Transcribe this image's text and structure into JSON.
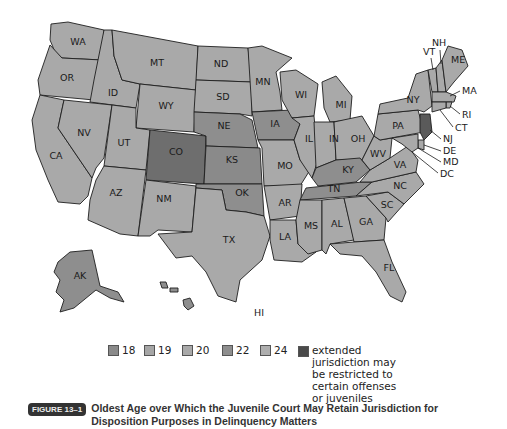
{
  "colors": {
    "age18": "#8a8a8a",
    "age19": "#a6a6a6",
    "age20": "#a9a9a9",
    "age22": "#8e8e8e",
    "age24": "#aeaeae",
    "extended": "#5a5a5a",
    "co": "#6e6e6e"
  },
  "legend": {
    "items": [
      {
        "label": "18",
        "color": "#8a8a8a"
      },
      {
        "label": "19",
        "color": "#a6a6a6"
      },
      {
        "label": "20",
        "color": "#a9a9a9"
      },
      {
        "label": "22",
        "color": "#8e8e8e"
      },
      {
        "label": "24",
        "color": "#aeaeae"
      }
    ],
    "extended": {
      "label": "extended jurisdiction may be restricted to certain offenses or juveniles",
      "color": "#4a4a4a"
    }
  },
  "caption": {
    "badge": "FIGURE 13–1",
    "text": "Oldest Age over Which the Juvenile Court May Retain Jurisdiction for Disposition Purposes in Delinquency Matters"
  },
  "states": {
    "WA": "WA",
    "OR": "OR",
    "CA": "CA",
    "ID": "ID",
    "NV": "NV",
    "MT": "MT",
    "WY": "WY",
    "UT": "UT",
    "AZ": "AZ",
    "CO": "CO",
    "NM": "NM",
    "ND": "ND",
    "SD": "SD",
    "NE": "NE",
    "KS": "KS",
    "OK": "OK",
    "TX": "TX",
    "MN": "MN",
    "IA": "IA",
    "MO": "MO",
    "AR": "AR",
    "LA": "LA",
    "WI": "WI",
    "IL": "IL",
    "MI": "MI",
    "IN": "IN",
    "OH": "OH",
    "KY": "KY",
    "TN": "TN",
    "MS": "MS",
    "AL": "AL",
    "GA": "GA",
    "FL": "FL",
    "SC": "SC",
    "NC": "NC",
    "VA": "VA",
    "WV": "WV",
    "PA": "PA",
    "NY": "NY",
    "VT": "VT",
    "NH": "NH",
    "ME": "ME",
    "MA": "MA",
    "RI": "RI",
    "CT": "CT",
    "NJ": "NJ",
    "DE": "DE",
    "MD": "MD",
    "DC": "DC",
    "AK": "AK",
    "HI": "HI"
  },
  "state_fill": {
    "CO": "#6e6e6e",
    "KS": "#8a8a8a",
    "NE": "#8e8e8e",
    "IA": "#8e8e8e",
    "OK": "#8e8e8e",
    "KY": "#8e8e8e",
    "TN": "#8e8e8e",
    "AK": "#8e8e8e",
    "HI": "#8e8e8e",
    "NJ": "#5a5a5a",
    "default": "#a9a9a9"
  }
}
